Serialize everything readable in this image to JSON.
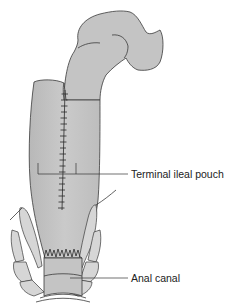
{
  "diagram": {
    "type": "anatomical-illustration",
    "labels": [
      {
        "id": "terminal-ileal-pouch",
        "text": "Terminal ileal pouch"
      },
      {
        "id": "anal-canal",
        "text": "Anal canal"
      }
    ],
    "colors": {
      "tissue": "#c4c4c4",
      "tissue_light": "#d6d6d6",
      "outline": "#3a3a3a",
      "background": "#ffffff"
    }
  }
}
